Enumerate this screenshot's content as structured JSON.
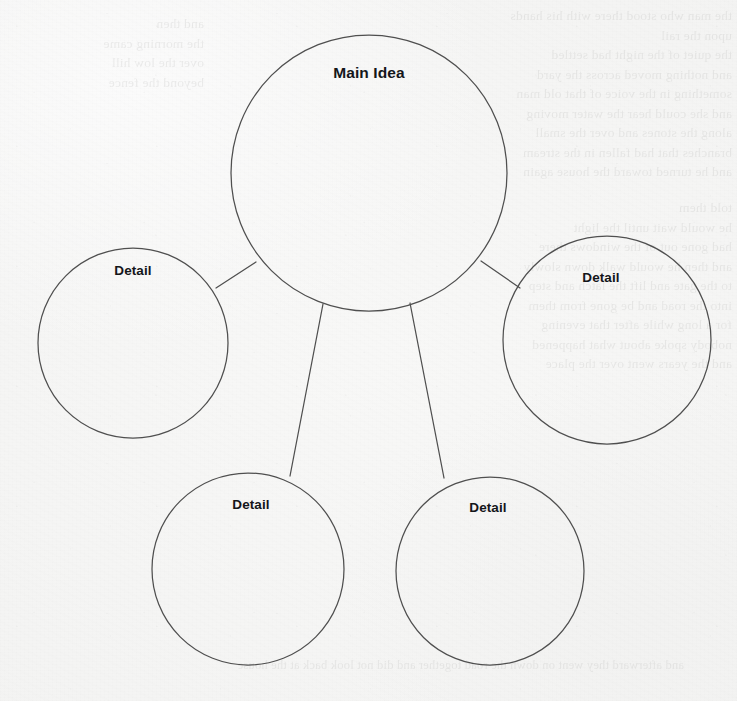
{
  "page": {
    "media": "scanned-paper",
    "background_color": "#f7f7f6",
    "ink_color": "#4f4f4f",
    "text_color": "#14161a"
  },
  "diagram": {
    "type": "spider-map",
    "center_node": {
      "id": "main-idea",
      "label": "Main Idea",
      "cx": 369,
      "cy": 173,
      "r": 138,
      "label_x": 369,
      "label_y": 73
    },
    "detail_nodes": [
      {
        "id": "detail-left",
        "label": "Detail",
        "cx": 133,
        "cy": 343,
        "r": 95,
        "label_x": 133,
        "label_y": 270
      },
      {
        "id": "detail-right",
        "label": "Detail",
        "cx": 607,
        "cy": 340,
        "r": 104,
        "label_x": 601,
        "label_y": 277
      },
      {
        "id": "detail-bottom-left",
        "label": "Detail",
        "cx": 248,
        "cy": 569,
        "r": 96,
        "label_x": 251,
        "label_y": 504
      },
      {
        "id": "detail-bottom-right",
        "label": "Detail",
        "cx": 490,
        "cy": 571,
        "r": 94,
        "label_x": 488,
        "label_y": 507
      }
    ],
    "connectors": [
      {
        "id": "connector-main-to-left",
        "from": "main-idea",
        "to": "detail-left",
        "x1": 256,
        "y1": 262,
        "x2": 216,
        "y2": 288
      },
      {
        "id": "connector-main-to-right",
        "from": "main-idea",
        "to": "detail-right",
        "x1": 481,
        "y1": 261,
        "x2": 520,
        "y2": 288
      },
      {
        "id": "connector-main-to-bottom-left",
        "from": "main-idea",
        "to": "detail-bottom-left",
        "x1": 323,
        "y1": 304,
        "x2": 290,
        "y2": 476
      },
      {
        "id": "connector-main-to-bottom-right",
        "from": "main-idea",
        "to": "detail-bottom-right",
        "x1": 410,
        "y1": 303,
        "x2": 444,
        "y2": 478
      }
    ]
  },
  "background_ghost_text": {
    "note": "Illegible bleed-through print from the reverse side of the sheet.",
    "blocks": [
      {
        "id": "ghost-top-right",
        "x": 360,
        "y": 6,
        "width": 372,
        "text": "the man who stood there with his hands\nupon the rail\nthe quiet of the night had settled\nand nothing moved across the yard\nsomething in the voice of that old man\nand she could hear the water moving\nalong the stones and over the small\nbranches that had fallen in the stream\nand he turned toward the house again"
      },
      {
        "id": "ghost-mid-right",
        "x": 388,
        "y": 198,
        "width": 344,
        "text": "told them\nhe would wait until the light\nhad gone out of the windows there\nand then he would walk down slowly\nto the gate and lift the latch and step\ninto the road and be gone from them\nfor a long while after that evening\nnobody spoke about what happened\nand the years went over the place"
      },
      {
        "id": "ghost-left-edge",
        "x": 8,
        "y": 14,
        "width": 196,
        "text": "and then\nthe morning came\nover the low hill\nbeyond the fence"
      },
      {
        "id": "ghost-bottom",
        "x": 24,
        "y": 656,
        "width": 660,
        "text": "and afterward they went on down the road together and did not look back at the house"
      }
    ]
  }
}
